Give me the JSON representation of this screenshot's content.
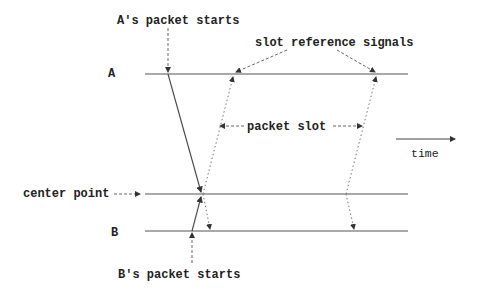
{
  "diagram": {
    "labels": {
      "a_packet_starts": "A's packet starts",
      "slot_reference_signals": "slot reference signals",
      "node_a": "A",
      "packet_slot": "packet slot",
      "time": "time",
      "center_point": "center point",
      "node_b": "B",
      "b_packet_starts": "B's packet starts"
    },
    "timelines": [
      {
        "name": "A",
        "y": 74
      },
      {
        "name": "center point",
        "y": 194
      },
      {
        "name": "B",
        "y": 231
      }
    ],
    "colors": {
      "line": "#555555",
      "text": "#222222"
    }
  }
}
